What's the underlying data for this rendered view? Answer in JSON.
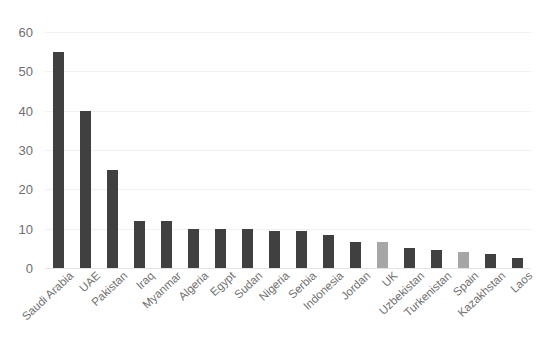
{
  "chart_data": {
    "type": "bar",
    "title": "",
    "xlabel": "",
    "ylabel": "",
    "ylim": [
      0,
      60
    ],
    "yticks": [
      0,
      10,
      20,
      30,
      40,
      50,
      60
    ],
    "grid": true,
    "legend": "none",
    "categories": [
      "Saudi Arabia",
      "UAE",
      "Pakistan",
      "Iraq",
      "Myanmar",
      "Algeria",
      "Egypt",
      "Sudan",
      "Nigeria",
      "Serbia",
      "Indonesia",
      "Jordan",
      "UK",
      "Uzbekistan",
      "Turkenistan",
      "Spain",
      "Kazakhstan",
      "Laos"
    ],
    "values": [
      55,
      40,
      25,
      12,
      12,
      10,
      10,
      10,
      9.5,
      9.5,
      8.5,
      6.5,
      6.5,
      5,
      4.5,
      4,
      3.5,
      2.5
    ],
    "bar_colors": [
      "#404040",
      "#404040",
      "#404040",
      "#404040",
      "#404040",
      "#404040",
      "#404040",
      "#404040",
      "#404040",
      "#404040",
      "#404040",
      "#404040",
      "#a6a6a6",
      "#404040",
      "#404040",
      "#a6a6a6",
      "#404040",
      "#404040"
    ],
    "colors": {
      "bar_dark": "#404040",
      "bar_light": "#a6a6a6",
      "gridline": "#f1f1f1",
      "baseline": "#e3e3e3",
      "tick_text": "#6f6f6f",
      "background": "#ffffff"
    }
  }
}
